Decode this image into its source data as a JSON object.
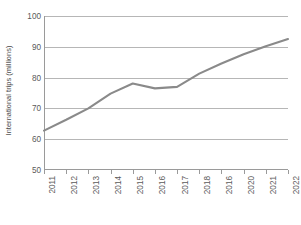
{
  "chart_data": {
    "type": "line",
    "title": "",
    "xlabel": "",
    "ylabel": "International trips (millions)",
    "categories": [
      "2011",
      "2012",
      "2013",
      "2014",
      "2015",
      "2016",
      "2017",
      "2018",
      "2016",
      "2020",
      "2021",
      "2022"
    ],
    "values": [
      62.8,
      66.3,
      70.0,
      74.8,
      78.1,
      76.5,
      77.0,
      81.3,
      84.6,
      87.6,
      90.2,
      92.5
    ],
    "series": [
      {
        "name": "International trips",
        "values": [
          62.8,
          66.3,
          70.0,
          74.8,
          78.1,
          76.5,
          77.0,
          81.3,
          84.6,
          87.6,
          90.2,
          92.5
        ]
      }
    ],
    "ylim": [
      50,
      100
    ],
    "yticks": [
      50,
      60,
      70,
      80,
      90,
      100
    ],
    "ytick_labels": [
      "50",
      "60",
      "70",
      "80",
      "90",
      "100"
    ],
    "grid": true,
    "legend": "none",
    "line_color": "#8a8a8a",
    "gridline_color": "#b6b6b6",
    "axis_color": "#9a9a9a",
    "background_color": "#ffffff"
  }
}
